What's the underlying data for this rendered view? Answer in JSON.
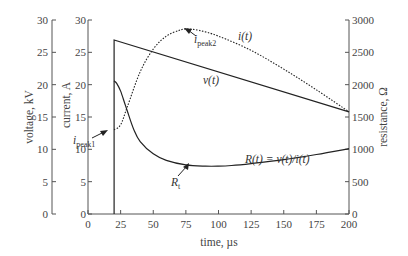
{
  "chart_data": {
    "type": "line",
    "title": "",
    "xlabel": "time, µs",
    "xlim": [
      0,
      200
    ],
    "x_ticks": [
      0,
      25,
      50,
      75,
      100,
      125,
      150,
      175,
      200
    ],
    "axes": {
      "voltage": {
        "label": "voltage, kV",
        "ylim": [
          0,
          30
        ],
        "ticks": [
          0,
          5,
          10,
          15,
          20,
          25,
          30
        ],
        "position": "left-outer"
      },
      "current": {
        "label": "current, A",
        "ylim": [
          0,
          30
        ],
        "ticks": [
          0,
          5,
          10,
          15,
          20,
          25,
          30
        ],
        "position": "left-inner"
      },
      "resistance": {
        "label": "resistance, Ω",
        "ylim": [
          0,
          3000
        ],
        "ticks": [
          0,
          500,
          1000,
          1500,
          2000,
          2500,
          3000
        ],
        "position": "right"
      }
    },
    "grid": false,
    "legend": "none (inline annotations)",
    "series": [
      {
        "name": "v(t)",
        "axis": "voltage",
        "style": "solid",
        "x": [
          20,
          20,
          200
        ],
        "values": [
          0,
          26.9,
          15.8
        ]
      },
      {
        "name": "i(t)",
        "axis": "current",
        "style": "dotted",
        "x": [
          20,
          25,
          30,
          40,
          50,
          60,
          70,
          75,
          85,
          100,
          125,
          150,
          175,
          200
        ],
        "values": [
          13.0,
          13.8,
          16.5,
          22.0,
          25.5,
          27.5,
          28.4,
          28.6,
          28.4,
          27.5,
          25.3,
          22.4,
          19.2,
          15.8
        ]
      },
      {
        "name": "R(t)=v(t)/i(t)",
        "axis": "resistance",
        "style": "solid",
        "x": [
          20,
          22,
          25,
          28,
          30,
          35,
          40,
          50,
          60,
          75,
          90,
          100,
          110,
          125,
          150,
          175,
          200
        ],
        "values": [
          2060,
          2020,
          1900,
          1720,
          1600,
          1310,
          1120,
          930,
          830,
          760,
          740,
          740,
          750,
          780,
          840,
          920,
          1010
        ]
      }
    ],
    "annotations": [
      {
        "text": "i(t)",
        "x": 182,
        "y_current": 28.2
      },
      {
        "text": "v(t)",
        "x": 145,
        "y_voltage": 22.3
      },
      {
        "text": "R(t) = v(t)/i(t)",
        "x": 135,
        "y_resistance": 1130
      },
      {
        "text": "i_peak1",
        "points_to": {
          "x": 20,
          "y_current": 13
        }
      },
      {
        "text": "i_peak2",
        "points_to": {
          "x": 74,
          "y_current": 28.6
        }
      },
      {
        "text": "R_t",
        "points_to": {
          "x": 94,
          "y_resistance": 740
        }
      }
    ]
  },
  "labels": {
    "xlabel": "time, µs",
    "voltage_label": "voltage, kV",
    "current_label": "current, A",
    "resistance_label": "resistance, Ω",
    "i_t": "i(t)",
    "v_t": "v(t)",
    "r_formula": "R(t) = v(t)/i(t)",
    "i_peak1_main": "i",
    "i_peak1_sub": "peak1",
    "i_peak2_main": "i",
    "i_peak2_sub": "peak2",
    "r_t_main": "R",
    "r_t_sub": "t"
  }
}
